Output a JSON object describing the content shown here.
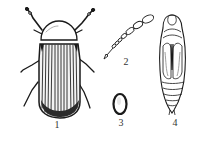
{
  "figure": {
    "background": "#ffffff",
    "ink": "#1a1a1a",
    "panels": [
      {
        "id": "adult",
        "label": "1",
        "description": "adult beetle, dorsal view"
      },
      {
        "id": "antenna",
        "label": "2",
        "description": "antenna"
      },
      {
        "id": "egg",
        "label": "3",
        "description": "egg"
      },
      {
        "id": "pupa",
        "label": "4",
        "description": "pupa, ventral view"
      }
    ]
  }
}
